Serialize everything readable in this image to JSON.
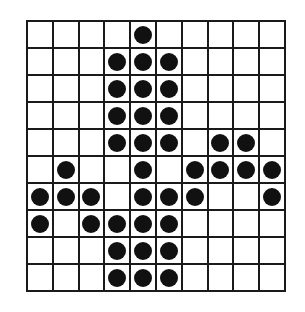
{
  "figure": {
    "grid_line_color": "#1a1a1a",
    "dot_color": "#111111",
    "background_color": "#ffffff"
  },
  "chart_data": {
    "type": "heatmap",
    "title": "",
    "xlabel": "",
    "ylabel": "",
    "rows": 10,
    "columns": 10,
    "grid": true,
    "legend": "none",
    "value_meaning": {
      "1": "filled dot",
      "0": "empty cell"
    },
    "row_labels": [
      "1",
      "2",
      "3",
      "4",
      "5",
      "6",
      "7",
      "8",
      "9",
      "10"
    ],
    "column_labels": [
      "1",
      "2",
      "3",
      "4",
      "5",
      "6",
      "7",
      "8",
      "9",
      "10"
    ],
    "values": [
      [
        0,
        0,
        0,
        0,
        1,
        0,
        0,
        0,
        0,
        0
      ],
      [
        0,
        0,
        0,
        1,
        1,
        1,
        0,
        0,
        0,
        0
      ],
      [
        0,
        0,
        0,
        1,
        1,
        1,
        0,
        0,
        0,
        0
      ],
      [
        0,
        0,
        0,
        1,
        1,
        1,
        0,
        0,
        0,
        0
      ],
      [
        0,
        0,
        0,
        1,
        1,
        1,
        0,
        1,
        1,
        0
      ],
      [
        0,
        1,
        0,
        0,
        1,
        0,
        1,
        1,
        1,
        1
      ],
      [
        1,
        1,
        1,
        0,
        1,
        1,
        1,
        0,
        0,
        1
      ],
      [
        1,
        0,
        1,
        1,
        1,
        1,
        0,
        0,
        0,
        0
      ],
      [
        0,
        0,
        0,
        1,
        1,
        1,
        0,
        0,
        0,
        0
      ],
      [
        0,
        0,
        0,
        1,
        1,
        1,
        0,
        0,
        0,
        0
      ]
    ],
    "filled_cells_per_row": [
      1,
      3,
      3,
      3,
      5,
      6,
      7,
      5,
      3,
      3
    ],
    "total_filled": 39,
    "total_cells": 100
  }
}
